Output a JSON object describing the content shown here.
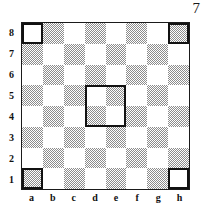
{
  "page": {
    "page_number": "7"
  },
  "board": {
    "files": [
      "a",
      "b",
      "c",
      "d",
      "e",
      "f",
      "g",
      "h"
    ],
    "ranks": [
      "8",
      "7",
      "6",
      "5",
      "4",
      "3",
      "2",
      "1"
    ],
    "light_color": "#ffffff",
    "dark_color": "#8c8c8c",
    "outline_color": "#111111",
    "size": 8,
    "marked_squares": [
      {
        "square": "a8",
        "shade": "light"
      },
      {
        "square": "h8",
        "shade": "dark"
      },
      {
        "square": "a1",
        "shade": "dark"
      },
      {
        "square": "h1",
        "shade": "light"
      }
    ],
    "highlight_box": {
      "squares": [
        "d5",
        "e5",
        "d4",
        "e4"
      ],
      "file_start": 3,
      "file_span": 2,
      "rank_row_start": 3,
      "rank_row_span": 2
    }
  },
  "chart_data": {
    "type": "heatmap",
    "title": "",
    "xlabel": "",
    "ylabel": "",
    "categories": [
      "a",
      "b",
      "c",
      "d",
      "e",
      "f",
      "g",
      "h"
    ],
    "rows": [
      "8",
      "7",
      "6",
      "5",
      "4",
      "3",
      "2",
      "1"
    ],
    "legend": [],
    "grid": true,
    "values": [
      [
        0,
        1,
        0,
        1,
        0,
        1,
        0,
        1
      ],
      [
        1,
        0,
        1,
        0,
        1,
        0,
        1,
        0
      ],
      [
        0,
        1,
        0,
        1,
        0,
        1,
        0,
        1
      ],
      [
        1,
        0,
        1,
        0,
        1,
        0,
        1,
        0
      ],
      [
        0,
        1,
        0,
        1,
        0,
        1,
        0,
        1
      ],
      [
        1,
        0,
        1,
        0,
        1,
        0,
        1,
        0
      ],
      [
        0,
        1,
        0,
        1,
        0,
        1,
        0,
        1
      ],
      [
        1,
        0,
        1,
        0,
        1,
        0,
        1,
        0
      ]
    ],
    "annotations": [
      {
        "square": "a8",
        "type": "outline"
      },
      {
        "square": "h8",
        "type": "outline"
      },
      {
        "square": "a1",
        "type": "outline"
      },
      {
        "square": "h1",
        "type": "outline"
      },
      {
        "square": "d4-e5",
        "type": "outline-block"
      }
    ]
  }
}
